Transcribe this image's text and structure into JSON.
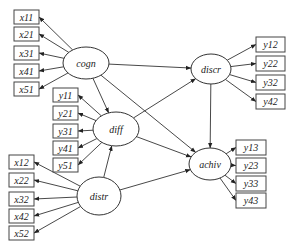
{
  "diagram": {
    "type": "structural-equation-model",
    "latent": {
      "cogn": {
        "label": "cogn",
        "cx": 86,
        "cy": 63,
        "rx": 23,
        "ry": 16
      },
      "diff": {
        "label": "diff",
        "cx": 116,
        "cy": 129,
        "rx": 23,
        "ry": 17
      },
      "distr": {
        "label": "distr",
        "cx": 99,
        "cy": 196,
        "rx": 22,
        "ry": 19
      },
      "discr": {
        "label": "discr",
        "cx": 211,
        "cy": 69,
        "rx": 20,
        "ry": 15
      },
      "achiv": {
        "label": "achiv",
        "cx": 210,
        "cy": 164,
        "rx": 21,
        "ry": 16
      }
    },
    "indicators": {
      "cogn": [
        {
          "label": "x11",
          "x": 14,
          "y": 10,
          "w": 25,
          "h": 14
        },
        {
          "label": "x21",
          "x": 14,
          "y": 27,
          "w": 25,
          "h": 14
        },
        {
          "label": "x31",
          "x": 14,
          "y": 46,
          "w": 25,
          "h": 14
        },
        {
          "label": "x41",
          "x": 14,
          "y": 64,
          "w": 25,
          "h": 14
        },
        {
          "label": "x51",
          "x": 14,
          "y": 82,
          "w": 25,
          "h": 14
        }
      ],
      "diff": [
        {
          "label": "y11",
          "x": 53,
          "y": 88,
          "w": 25,
          "h": 14
        },
        {
          "label": "y21",
          "x": 53,
          "y": 106,
          "w": 25,
          "h": 14
        },
        {
          "label": "y31",
          "x": 53,
          "y": 124,
          "w": 25,
          "h": 14
        },
        {
          "label": "y41",
          "x": 53,
          "y": 141,
          "w": 25,
          "h": 14
        },
        {
          "label": "y51",
          "x": 53,
          "y": 158,
          "w": 25,
          "h": 14
        }
      ],
      "distr": [
        {
          "label": "x12",
          "x": 9,
          "y": 155,
          "w": 25,
          "h": 14
        },
        {
          "label": "x22",
          "x": 9,
          "y": 173,
          "w": 25,
          "h": 14
        },
        {
          "label": "x32",
          "x": 9,
          "y": 192,
          "w": 25,
          "h": 14
        },
        {
          "label": "x42",
          "x": 9,
          "y": 209,
          "w": 25,
          "h": 14
        },
        {
          "label": "x52",
          "x": 9,
          "y": 226,
          "w": 25,
          "h": 14
        }
      ],
      "discr": [
        {
          "label": "y12",
          "x": 256,
          "y": 37,
          "w": 29,
          "h": 15
        },
        {
          "label": "y22",
          "x": 256,
          "y": 56,
          "w": 29,
          "h": 15
        },
        {
          "label": "y32",
          "x": 256,
          "y": 75,
          "w": 29,
          "h": 15
        },
        {
          "label": "y42",
          "x": 256,
          "y": 94,
          "w": 29,
          "h": 15
        }
      ],
      "achiv": [
        {
          "label": "y13",
          "x": 236,
          "y": 140,
          "w": 30,
          "h": 15
        },
        {
          "label": "y23",
          "x": 236,
          "y": 158,
          "w": 30,
          "h": 15
        },
        {
          "label": "y33",
          "x": 236,
          "y": 176,
          "w": 30,
          "h": 15
        },
        {
          "label": "y43",
          "x": 236,
          "y": 193,
          "w": 30,
          "h": 15
        }
      ]
    },
    "paths": [
      {
        "from": "cogn",
        "to": "discr"
      },
      {
        "from": "cogn",
        "to": "diff"
      },
      {
        "from": "cogn",
        "to": "achiv"
      },
      {
        "from": "diff",
        "to": "discr"
      },
      {
        "from": "diff",
        "to": "achiv"
      },
      {
        "from": "distr",
        "to": "diff"
      },
      {
        "from": "distr",
        "to": "achiv"
      },
      {
        "from": "discr",
        "to": "achiv"
      }
    ]
  }
}
